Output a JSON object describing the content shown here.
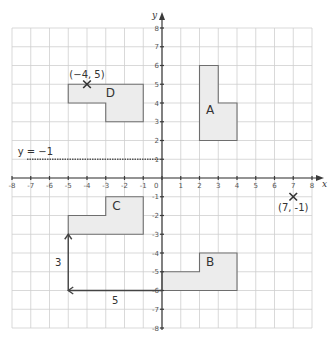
{
  "diagram": {
    "axes": {
      "x_label": "x",
      "y_label": "y",
      "x_range": [
        -8,
        8
      ],
      "y_range": [
        -8,
        8
      ],
      "x_ticks": [
        "-8",
        "-7",
        "-6",
        "-5",
        "-4",
        "-3",
        "-2",
        "-1",
        "0",
        "1",
        "2",
        "3",
        "4",
        "5",
        "6",
        "7",
        "8"
      ],
      "y_ticks": [
        "8",
        "7",
        "6",
        "5",
        "4",
        "3",
        "2",
        "1",
        "-1",
        "-2",
        "-3",
        "-4",
        "-5",
        "-6",
        "-7",
        "-8"
      ],
      "origin_label": "0"
    },
    "shapes": [
      {
        "id": "A",
        "label": "A",
        "vertices": [
          [
            2,
            6
          ],
          [
            3,
            6
          ],
          [
            3,
            4
          ],
          [
            4,
            4
          ],
          [
            4,
            2
          ],
          [
            2,
            2
          ]
        ],
        "label_at": [
          2.35,
          3.4
        ]
      },
      {
        "id": "B",
        "label": "B",
        "vertices": [
          [
            2,
            -4
          ],
          [
            4,
            -4
          ],
          [
            4,
            -6
          ],
          [
            0,
            -6
          ],
          [
            0,
            -5
          ],
          [
            2,
            -5
          ]
        ],
        "label_at": [
          2.35,
          -4.7
        ]
      },
      {
        "id": "C",
        "label": "C",
        "vertices": [
          [
            -3,
            -1
          ],
          [
            -1,
            -1
          ],
          [
            -1,
            -3
          ],
          [
            -5,
            -3
          ],
          [
            -5,
            -2
          ],
          [
            -3,
            -2
          ]
        ],
        "label_at": [
          -2.65,
          -1.7
        ]
      },
      {
        "id": "D",
        "label": "D",
        "vertices": [
          [
            -5,
            5
          ],
          [
            -1,
            5
          ],
          [
            -1,
            3
          ],
          [
            -3,
            3
          ],
          [
            -3,
            4
          ],
          [
            -5,
            4
          ]
        ],
        "label_at": [
          -3.0,
          4.3
        ]
      }
    ],
    "points": [
      {
        "label": "(−4, 5)",
        "x": -4,
        "y": 5
      },
      {
        "label": "(7, -1)",
        "x": 7,
        "y": -1
      }
    ],
    "line": {
      "label": "y = −1",
      "y": 1,
      "x_from": -7.2,
      "x_to": 0
    },
    "arrows": [
      {
        "label": "5",
        "from": [
          0,
          -6
        ],
        "to": [
          -5,
          -6
        ]
      },
      {
        "label": "3",
        "from": [
          -5,
          -6
        ],
        "to": [
          -5,
          -3
        ]
      }
    ],
    "colors": {
      "shape_fill": "#ececec",
      "shape_stroke": "#6e6e6e",
      "grid": "#cfcfcf",
      "axis": "#3a3a3a"
    }
  }
}
